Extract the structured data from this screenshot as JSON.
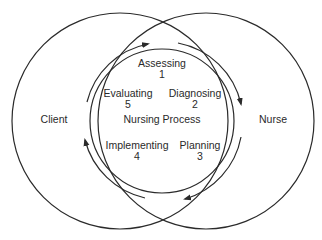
{
  "diagram": {
    "outer_left_label": "Client",
    "outer_right_label": "Nurse",
    "center_label": "Nursing Process",
    "steps": [
      {
        "name": "Assessing",
        "number": "1"
      },
      {
        "name": "Diagnosing",
        "number": "2"
      },
      {
        "name": "Planning",
        "number": "3"
      },
      {
        "name": "Implementing",
        "number": "4"
      },
      {
        "name": "Evaluating",
        "number": "5"
      }
    ],
    "stroke_color": "#2a2a2a",
    "background": "#ffffff"
  }
}
